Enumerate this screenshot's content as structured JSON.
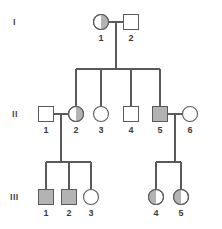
{
  "figure": {
    "kind": "pedigree-chart",
    "width": 222,
    "height": 229,
    "background_color": "#ffffff",
    "line_color": "#5a5a5a",
    "fill_affected_color": "#b3b3b3",
    "fill_unaffected_color": "#ffffff",
    "fill_carrier_color": "#b3b3b3",
    "label_color": "#3c3c3c"
  },
  "generations": [
    {
      "id": "I",
      "label": "I",
      "label_x": 13,
      "label_y": 25,
      "row_y": 22
    },
    {
      "id": "II",
      "label": "II",
      "label_x": 12,
      "label_y": 117,
      "row_y": 114
    },
    {
      "id": "III",
      "label": "III",
      "label_x": 10,
      "label_y": 200,
      "row_y": 197
    }
  ],
  "individuals": [
    {
      "key": "I-1",
      "generation": "I",
      "number": "1",
      "sex": "female",
      "shape": "circle",
      "status": "carrier",
      "shaded_half": "right",
      "cx": 101,
      "cy": 22,
      "size": 15,
      "label_x": 101,
      "label_y": 41
    },
    {
      "key": "I-2",
      "generation": "I",
      "number": "2",
      "sex": "male",
      "shape": "square",
      "status": "unaffected",
      "shaded_half": "none",
      "cx": 131,
      "cy": 22,
      "size": 15,
      "label_x": 131,
      "label_y": 41
    },
    {
      "key": "II-1",
      "generation": "II",
      "number": "1",
      "sex": "male",
      "shape": "square",
      "status": "unaffected",
      "shaded_half": "none",
      "cx": 46,
      "cy": 114,
      "size": 15,
      "label_x": 46,
      "label_y": 133
    },
    {
      "key": "II-2",
      "generation": "II",
      "number": "2",
      "sex": "female",
      "shape": "circle",
      "status": "carrier",
      "shaded_half": "right",
      "cx": 76,
      "cy": 114,
      "size": 15,
      "label_x": 76,
      "label_y": 133
    },
    {
      "key": "II-3",
      "generation": "II",
      "number": "3",
      "sex": "female",
      "shape": "circle",
      "status": "unaffected",
      "shaded_half": "none",
      "cx": 101,
      "cy": 114,
      "size": 15,
      "label_x": 101,
      "label_y": 133
    },
    {
      "key": "II-4",
      "generation": "II",
      "number": "4",
      "sex": "male",
      "shape": "square",
      "status": "unaffected",
      "shaded_half": "none",
      "cx": 131,
      "cy": 114,
      "size": 15,
      "label_x": 131,
      "label_y": 133
    },
    {
      "key": "II-5",
      "generation": "II",
      "number": "5",
      "sex": "male",
      "shape": "square",
      "status": "affected",
      "shaded_half": "full",
      "cx": 160,
      "cy": 114,
      "size": 15,
      "label_x": 160,
      "label_y": 133
    },
    {
      "key": "II-6",
      "generation": "II",
      "number": "6",
      "sex": "female",
      "shape": "circle",
      "status": "unaffected",
      "shaded_half": "none",
      "cx": 190,
      "cy": 114,
      "size": 15,
      "label_x": 190,
      "label_y": 133
    },
    {
      "key": "III-1",
      "generation": "III",
      "number": "1",
      "sex": "male",
      "shape": "square",
      "status": "affected",
      "shaded_half": "full",
      "cx": 46,
      "cy": 197,
      "size": 15,
      "label_x": 46,
      "label_y": 216
    },
    {
      "key": "III-2",
      "generation": "III",
      "number": "2",
      "sex": "male",
      "shape": "square",
      "status": "affected",
      "shaded_half": "full",
      "cx": 69,
      "cy": 197,
      "size": 15,
      "label_x": 69,
      "label_y": 216
    },
    {
      "key": "III-3",
      "generation": "III",
      "number": "3",
      "sex": "female",
      "shape": "circle",
      "status": "unaffected",
      "shaded_half": "none",
      "cx": 91,
      "cy": 197,
      "size": 15,
      "label_x": 91,
      "label_y": 216
    },
    {
      "key": "III-4",
      "generation": "III",
      "number": "4",
      "sex": "female",
      "shape": "circle",
      "status": "carrier",
      "shaded_half": "left",
      "cx": 156,
      "cy": 197,
      "size": 15,
      "label_x": 156,
      "label_y": 216
    },
    {
      "key": "III-5",
      "generation": "III",
      "number": "5",
      "sex": "female",
      "shape": "circle",
      "status": "carrier",
      "shaded_half": "left",
      "cx": 181,
      "cy": 197,
      "size": 15,
      "label_x": 181,
      "label_y": 216
    }
  ],
  "matings": [
    {
      "key": "mate-I1-I2",
      "partners": [
        "I-1",
        "I-2"
      ],
      "line": {
        "x1": 109,
        "y1": 22,
        "x2": 123,
        "y2": 22
      },
      "drop": {
        "x": 116,
        "y1": 22,
        "y2": 69
      }
    },
    {
      "key": "mate-II1-II2",
      "partners": [
        "II-1",
        "II-2"
      ],
      "line": {
        "x1": 54,
        "y1": 114,
        "x2": 68,
        "y2": 114
      },
      "drop": {
        "x": 61,
        "y1": 114,
        "y2": 162
      }
    },
    {
      "key": "mate-II5-II6",
      "partners": [
        "II-5",
        "II-6"
      ],
      "line": {
        "x1": 168,
        "y1": 114,
        "x2": 182,
        "y2": 114
      },
      "drop": {
        "x": 175,
        "y1": 114,
        "y2": 162
      }
    }
  ],
  "sibships": [
    {
      "key": "sibship-gen2",
      "parents": "mate-I1-I2",
      "sib_line": {
        "x1": 76,
        "x2": 160,
        "y": 69
      },
      "children": [
        {
          "key": "II-2",
          "x": 76,
          "y1": 69,
          "y2": 106
        },
        {
          "key": "II-3",
          "x": 101,
          "y1": 69,
          "y2": 106
        },
        {
          "key": "II-4",
          "x": 131,
          "y1": 69,
          "y2": 106
        },
        {
          "key": "II-5",
          "x": 160,
          "y1": 69,
          "y2": 106
        }
      ]
    },
    {
      "key": "sibship-gen3-left",
      "parents": "mate-II1-II2",
      "sib_line": {
        "x1": 46,
        "x2": 91,
        "y": 162
      },
      "children": [
        {
          "key": "III-1",
          "x": 46,
          "y1": 162,
          "y2": 189
        },
        {
          "key": "III-2",
          "x": 69,
          "y1": 162,
          "y2": 189
        },
        {
          "key": "III-3",
          "x": 91,
          "y1": 162,
          "y2": 189
        }
      ]
    },
    {
      "key": "sibship-gen3-right",
      "parents": "mate-II5-II6",
      "sib_line": {
        "x1": 156,
        "x2": 181,
        "y": 162
      },
      "children": [
        {
          "key": "III-4",
          "x": 156,
          "y1": 162,
          "y2": 189
        },
        {
          "key": "III-5",
          "x": 181,
          "y1": 162,
          "y2": 189
        }
      ]
    }
  ]
}
